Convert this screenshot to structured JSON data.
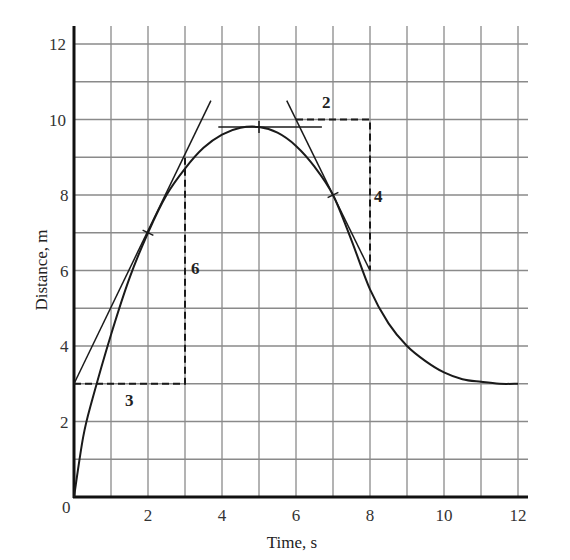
{
  "chart_data": {
    "type": "line",
    "title": "",
    "xlabel": "Time, s",
    "ylabel": "Distance, m",
    "xlim": [
      0,
      12
    ],
    "ylim": [
      0,
      12
    ],
    "grid": true,
    "x_ticks": [
      "0",
      "2",
      "4",
      "6",
      "8",
      "10",
      "12"
    ],
    "y_ticks": [
      "0",
      "2",
      "4",
      "6",
      "8",
      "10",
      "12"
    ],
    "series": [
      {
        "name": "distance curve",
        "x": [
          0,
          0.25,
          0.5,
          1,
          1.5,
          2,
          2.5,
          3,
          3.5,
          4,
          4.5,
          5,
          5.5,
          6,
          6.5,
          7,
          7.5,
          8,
          8.5,
          9,
          9.5,
          10,
          10.5,
          11,
          11.5,
          12
        ],
        "values": [
          0,
          1.6,
          2.6,
          4.3,
          5.8,
          7.0,
          8.0,
          8.7,
          9.25,
          9.6,
          9.78,
          9.8,
          9.65,
          9.3,
          8.75,
          8.0,
          6.8,
          5.5,
          4.6,
          4.0,
          3.6,
          3.3,
          3.12,
          3.05,
          3.0,
          3.0
        ]
      }
    ],
    "tangent_lines": [
      {
        "name": "tangent at t=2",
        "from": [
          0,
          3
        ],
        "to": [
          3.7,
          10.5
        ],
        "touch_point": [
          2,
          7
        ],
        "slope": 2
      },
      {
        "name": "tangent at t=5",
        "from": [
          3.9,
          9.8
        ],
        "to": [
          6.7,
          9.8
        ],
        "touch_point": [
          5,
          9.8
        ],
        "slope": 0
      },
      {
        "name": "tangent at t=7",
        "from": [
          5.75,
          10.5
        ],
        "to": [
          8.0,
          6.0
        ],
        "touch_point": [
          7,
          8
        ],
        "slope": -2
      }
    ],
    "annotations": [
      {
        "type": "dashed-run-rise",
        "path": [
          [
            0,
            3
          ],
          [
            3,
            3
          ],
          [
            3,
            9
          ]
        ],
        "run_label": "3",
        "rise_label": "6"
      },
      {
        "type": "dashed-run-rise",
        "path": [
          [
            6,
            10
          ],
          [
            8,
            10
          ],
          [
            8,
            6
          ]
        ],
        "run_label": "2",
        "rise_label": "4"
      }
    ]
  },
  "labels": {
    "xlabel": "Time, s",
    "ylabel": "Distance, m",
    "x_ticks": [
      "0",
      "2",
      "4",
      "6",
      "8",
      "10",
      "12"
    ],
    "y_ticks": [
      "2",
      "4",
      "6",
      "8",
      "10",
      "12"
    ],
    "origin": "0",
    "annot_run1": "3",
    "annot_rise1": "6",
    "annot_run2": "2",
    "annot_rise2": "4"
  },
  "colors": {
    "ink": "#1a1a1a",
    "grid": "#8a8a8a",
    "background": "#ffffff"
  }
}
